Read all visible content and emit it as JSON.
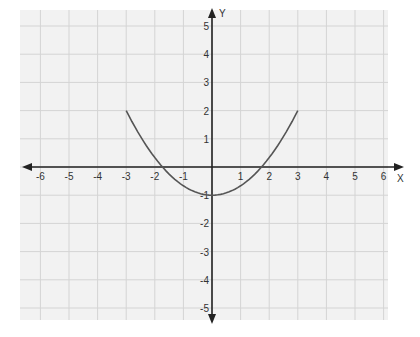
{
  "chart_data": {
    "type": "line",
    "title": "",
    "xlabel": "X",
    "ylabel": "Y",
    "xlim": [
      -6,
      6
    ],
    "ylim": [
      -5,
      5
    ],
    "grid": true,
    "x_ticks": [
      -6,
      -5,
      -4,
      -3,
      -2,
      -1,
      1,
      2,
      3,
      4,
      5,
      6
    ],
    "y_ticks": [
      -5,
      -4,
      -3,
      -2,
      -1,
      1,
      2,
      3,
      4,
      5
    ],
    "series": [
      {
        "name": "parabola",
        "equation": "y = 0.333x^2 - 1",
        "x": [
          -3,
          -2.5,
          -2,
          -1.5,
          -1,
          -0.5,
          0,
          0.5,
          1,
          1.5,
          2,
          2.5,
          3
        ],
        "y": [
          2,
          1.08,
          0.33,
          -0.25,
          -0.67,
          -0.92,
          -1,
          -0.92,
          -0.67,
          -0.25,
          0.33,
          1.08,
          2
        ],
        "color": "#555555"
      }
    ],
    "annotations": [
      {
        "label": "x-intercept",
        "x": -2,
        "y": 0
      },
      {
        "label": "x-intercept",
        "x": 2,
        "y": 0
      },
      {
        "label": "vertex",
        "x": 0,
        "y": -1
      }
    ]
  },
  "colors": {
    "background": "#f2f2f2",
    "grid": "#d4d4d4",
    "axis": "#222222",
    "curve": "#555555"
  }
}
